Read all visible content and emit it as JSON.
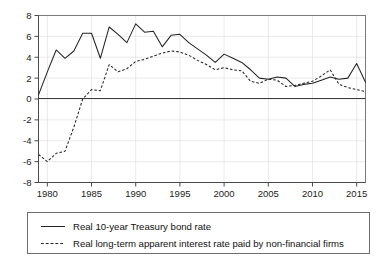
{
  "chart_data": {
    "type": "line",
    "title": "",
    "subtitle": "",
    "xlabel": "",
    "ylabel": "",
    "xlim": [
      1979,
      2016
    ],
    "ylim": [
      -8,
      8
    ],
    "grid": true,
    "legend_position": "below-plot",
    "y_ticks": [
      "8",
      "6",
      "4",
      "2",
      "0",
      "-2",
      "-4",
      "-6",
      "-8"
    ],
    "y_tick_values": [
      8,
      6,
      4,
      2,
      0,
      -2,
      -4,
      -6,
      -8
    ],
    "x_ticks": [
      "1980",
      "1985",
      "1990",
      "1995",
      "2000",
      "2005",
      "2010",
      "2015"
    ],
    "x_tick_values": [
      1980,
      1985,
      1990,
      1995,
      2000,
      2005,
      2010,
      2015
    ],
    "x": [
      1979,
      1980,
      1981,
      1982,
      1983,
      1984,
      1985,
      1986,
      1987,
      1988,
      1989,
      1990,
      1991,
      1992,
      1993,
      1994,
      1995,
      1996,
      1997,
      1998,
      1999,
      2000,
      2001,
      2002,
      2003,
      2004,
      2005,
      2006,
      2007,
      2008,
      2009,
      2010,
      2011,
      2012,
      2013,
      2014,
      2015,
      2016
    ],
    "series": [
      {
        "name": "Real 10-year Treasury bond rate",
        "style": "solid",
        "color": "#242424",
        "values": [
          0.4,
          2.6,
          4.7,
          3.9,
          4.6,
          6.3,
          6.3,
          3.9,
          6.9,
          6.2,
          5.4,
          7.2,
          6.4,
          6.5,
          5.0,
          6.1,
          6.2,
          5.4,
          4.8,
          4.2,
          3.5,
          4.3,
          3.9,
          3.5,
          2.8,
          2.0,
          1.9,
          2.1,
          2.0,
          1.2,
          1.4,
          1.5,
          1.8,
          2.1,
          1.9,
          2.0,
          3.4,
          1.6
        ]
      },
      {
        "name": "Real long-term apparent interest rate paid by non-financial firms",
        "style": "dashed",
        "color": "#242424",
        "values": [
          -5.3,
          -6.0,
          -5.2,
          -5.0,
          -2.7,
          0.0,
          0.9,
          0.8,
          3.3,
          2.6,
          2.9,
          3.6,
          3.8,
          4.1,
          4.4,
          4.6,
          4.5,
          4.2,
          3.7,
          3.3,
          2.8,
          3.0,
          2.8,
          2.7,
          1.7,
          1.5,
          1.9,
          1.8,
          1.2,
          1.3,
          1.5,
          1.7,
          2.2,
          2.8,
          1.4,
          1.1,
          0.9,
          0.7
        ]
      }
    ]
  },
  "legend": {
    "entries": [
      {
        "label": "Real 10-year Treasury bond rate",
        "style": "solid"
      },
      {
        "label": "Real long-term apparent interest rate paid by non-financial firms",
        "style": "dashed"
      }
    ]
  }
}
